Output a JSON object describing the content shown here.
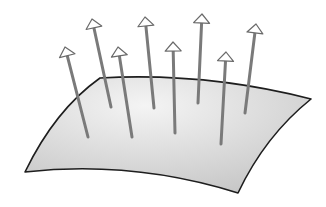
{
  "diagram": {
    "colors": {
      "background": "#ffffff",
      "surface_fill_light": "#f4f4f4",
      "surface_fill_dark": "#c4c4c4",
      "surface_edge": "#1e1e1e",
      "arrow_shaft": "#7a7a7a",
      "arrow_head_fill": "#ffffff",
      "arrow_head_stroke": "#6a6a6a"
    },
    "surface": {
      "corners": {
        "top_left": [
          100,
          78
        ],
        "top_right": [
          311,
          99
        ],
        "bottom_right": [
          238,
          193
        ],
        "bottom_left": [
          25,
          172
        ]
      }
    },
    "arrows": [
      {
        "base": [
          88,
          137
        ],
        "tip": [
          65,
          47
        ]
      },
      {
        "base": [
          111,
          107
        ],
        "tip": [
          92,
          19
        ]
      },
      {
        "base": [
          132,
          137
        ],
        "tip": [
          118,
          47
        ]
      },
      {
        "base": [
          154,
          108
        ],
        "tip": [
          145,
          17
        ]
      },
      {
        "base": [
          175,
          133
        ],
        "tip": [
          173,
          42
        ]
      },
      {
        "base": [
          198,
          103
        ],
        "tip": [
          202,
          14
        ]
      },
      {
        "base": [
          221,
          144
        ],
        "tip": [
          226,
          52
        ]
      },
      {
        "base": [
          245,
          113
        ],
        "tip": [
          256,
          24
        ]
      }
    ]
  }
}
